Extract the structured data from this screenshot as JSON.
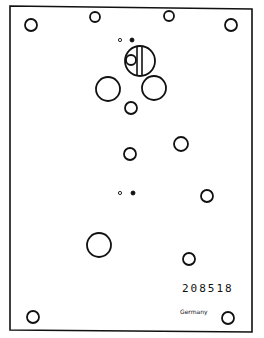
{
  "drawing": {
    "type": "plate-hole-layout",
    "part_number": "208518",
    "origin_text": "Germany",
    "stroke_color": "#111111",
    "background_color": "#ffffff",
    "holes": [
      {
        "id": "top-left-corner",
        "cx": 31,
        "cy": 25,
        "r": 6
      },
      {
        "id": "top-mid-left",
        "cx": 95,
        "cy": 17,
        "r": 5
      },
      {
        "id": "top-mid-right",
        "cx": 169,
        "cy": 16,
        "r": 5
      },
      {
        "id": "top-right-corner",
        "cx": 231,
        "cy": 25,
        "r": 6
      },
      {
        "id": "pin-upper-open",
        "cx": 120,
        "cy": 40,
        "r": 1.6
      },
      {
        "id": "pin-upper-filled",
        "cx": 132,
        "cy": 40,
        "r": 2,
        "filled": true
      },
      {
        "id": "main-bore",
        "cx": 140,
        "cy": 61,
        "r": 15
      },
      {
        "id": "main-bore-inner",
        "cx": 131,
        "cy": 60,
        "r": 5
      },
      {
        "id": "large-left",
        "cx": 108,
        "cy": 89,
        "r": 12
      },
      {
        "id": "large-right",
        "cx": 154,
        "cy": 88,
        "r": 12
      },
      {
        "id": "center-below",
        "cx": 131,
        "cy": 108,
        "r": 6
      },
      {
        "id": "mid-center",
        "cx": 130,
        "cy": 154,
        "r": 6
      },
      {
        "id": "mid-right",
        "cx": 181,
        "cy": 144,
        "r": 7
      },
      {
        "id": "pin-lower-open",
        "cx": 120,
        "cy": 193,
        "r": 1.6
      },
      {
        "id": "pin-lower-filled",
        "cx": 133,
        "cy": 193,
        "r": 2,
        "filled": true
      },
      {
        "id": "right-lower",
        "cx": 207,
        "cy": 196,
        "r": 6
      },
      {
        "id": "large-lower-left",
        "cx": 99,
        "cy": 245,
        "r": 12
      },
      {
        "id": "lower-right",
        "cx": 189,
        "cy": 259,
        "r": 6
      },
      {
        "id": "bottom-left-corner",
        "cx": 33,
        "cy": 317,
        "r": 6
      },
      {
        "id": "bottom-right-corner",
        "cx": 228,
        "cy": 318,
        "r": 6
      }
    ]
  }
}
